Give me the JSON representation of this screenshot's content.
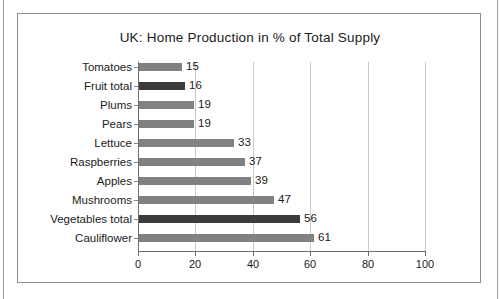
{
  "chart_data": {
    "type": "bar",
    "orientation": "horizontal",
    "title": "UK: Home Production in % of Total Supply",
    "xlabel": "",
    "ylabel": "",
    "xlim": [
      0,
      100
    ],
    "xticks": [
      "0",
      "20",
      "40",
      "60",
      "80",
      "100"
    ],
    "grid": "vertical",
    "legend": "none",
    "categories": [
      "Tomatoes",
      "Fruit total",
      "Plums",
      "Pears",
      "Lettuce",
      "Raspberries",
      "Apples",
      "Mushrooms",
      "Vegetables total",
      "Cauliflower"
    ],
    "values": [
      15,
      16,
      19,
      19,
      33,
      37,
      39,
      47,
      56,
      61
    ],
    "value_labels": [
      "15",
      "16",
      "19",
      "19",
      "33",
      "37",
      "39",
      "47",
      "56",
      "61"
    ],
    "bar_styles": [
      "normal",
      "total",
      "normal",
      "normal",
      "normal",
      "normal",
      "normal",
      "normal",
      "total",
      "normal"
    ],
    "colors": {
      "bar_normal": "#818181",
      "bar_total": "#3b3b3b",
      "gridline": "#c9c9c9",
      "axis": "#6e6e6e",
      "text": "#1a1a1a",
      "background": "#ffffff",
      "frame": "#8c8c8c"
    }
  }
}
